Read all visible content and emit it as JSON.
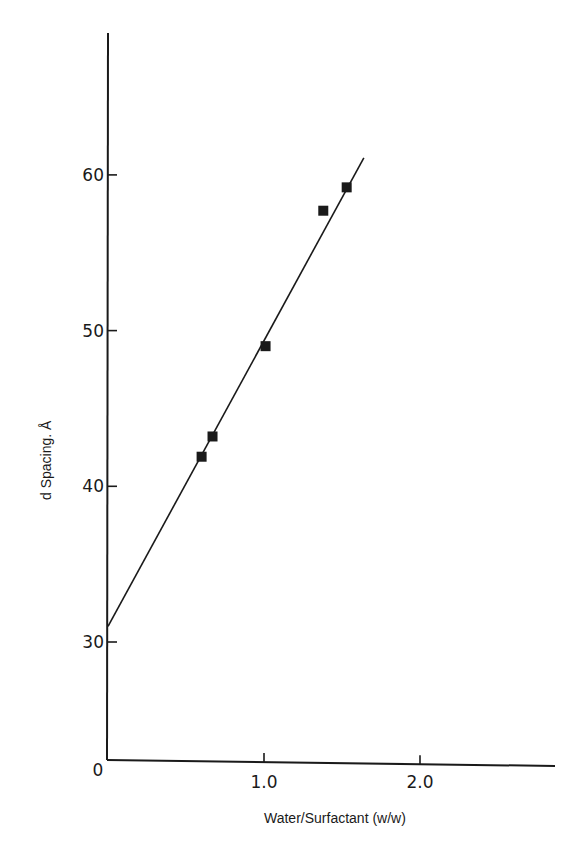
{
  "chart_data": {
    "type": "scatter",
    "title": "",
    "xlabel": "Water/Surfactant (w/w)",
    "ylabel": "d Spacing. Å",
    "xlim": [
      0,
      2.8
    ],
    "ylim": [
      22,
      69
    ],
    "origin_label": "0",
    "x_ticks": [
      {
        "value": 1.0,
        "label": "1.0"
      },
      {
        "value": 2.0,
        "label": "2.0"
      }
    ],
    "y_ticks": [
      {
        "value": 30,
        "label": "30"
      },
      {
        "value": 40,
        "label": "40"
      },
      {
        "value": 50,
        "label": "50"
      },
      {
        "value": 60,
        "label": "60"
      }
    ],
    "grid": false,
    "legend": null,
    "series": [
      {
        "name": "measured d spacing",
        "marker": "square",
        "points": [
          {
            "x": 0.6,
            "y": 41.9
          },
          {
            "x": 0.67,
            "y": 43.2
          },
          {
            "x": 1.01,
            "y": 49.0
          },
          {
            "x": 1.38,
            "y": 57.7
          },
          {
            "x": 1.53,
            "y": 59.2
          }
        ]
      },
      {
        "name": "linear fit",
        "type": "line",
        "points": [
          {
            "x": 0.0,
            "y": 31.0
          },
          {
            "x": 1.64,
            "y": 61.1
          }
        ]
      }
    ]
  },
  "colors": {
    "ink": "#1a1a1a",
    "background": "#ffffff"
  }
}
